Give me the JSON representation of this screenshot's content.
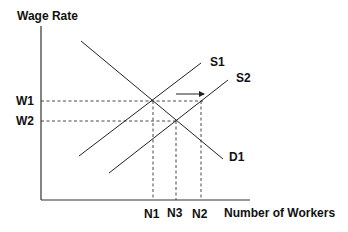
{
  "diagram": {
    "y_axis_label": "Wage Rate",
    "x_axis_label": "Number of Workers",
    "wage_levels": [
      {
        "label": "W1"
      },
      {
        "label": "W2"
      }
    ],
    "quantity_levels": [
      {
        "label": "N1"
      },
      {
        "label": "N3"
      },
      {
        "label": "N2"
      }
    ],
    "curves": [
      {
        "label": "S1",
        "type": "supply"
      },
      {
        "label": "S2",
        "type": "supply"
      },
      {
        "label": "D1",
        "type": "demand"
      }
    ],
    "annotation": "arrow indicating supply shift from S1 to S2",
    "colors": {
      "line": "#222222",
      "text": "#111111",
      "background": "#ffffff"
    }
  }
}
